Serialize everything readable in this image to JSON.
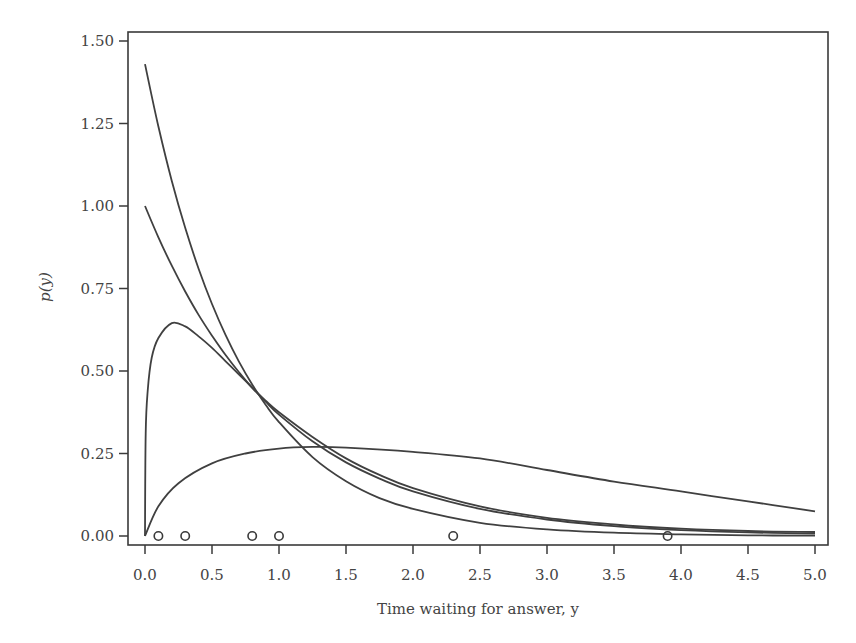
{
  "chart_data": {
    "type": "line",
    "title": "",
    "xlabel": "Time waiting for answer, y",
    "ylabel": "p(y)",
    "xlim": [
      0,
      5
    ],
    "ylim": [
      0,
      1.5
    ],
    "x_ticks": [
      "0.0",
      "0.5",
      "1.0",
      "1.5",
      "2.0",
      "2.5",
      "3.0",
      "3.5",
      "4.0",
      "4.5",
      "5.0"
    ],
    "y_ticks": [
      "0.00",
      "0.25",
      "0.50",
      "0.75",
      "1.00",
      "1.25",
      "1.50"
    ],
    "grid": false,
    "legend": null,
    "line_color": "#404040",
    "series": [
      {
        "name": "density-1",
        "x": [
          0.0,
          0.1,
          0.2,
          0.3,
          0.4,
          0.5,
          0.6,
          0.7,
          0.8,
          0.9,
          1.0,
          1.25,
          1.5,
          1.75,
          2.0,
          2.5,
          3.0,
          3.5,
          4.0,
          4.5,
          5.0
        ],
        "y": [
          1.43,
          1.241,
          1.076,
          0.934,
          0.81,
          0.703,
          0.61,
          0.529,
          0.459,
          0.398,
          0.345,
          0.239,
          0.166,
          0.115,
          0.082,
          0.04,
          0.02,
          0.01,
          0.005,
          0.002,
          0.001
        ]
      },
      {
        "name": "density-2",
        "x": [
          0.0,
          0.1,
          0.2,
          0.3,
          0.4,
          0.5,
          0.6,
          0.7,
          0.8,
          0.9,
          1.0,
          1.25,
          1.5,
          1.75,
          2.0,
          2.5,
          3.0,
          3.5,
          4.0,
          4.5,
          5.0
        ],
        "y": [
          1.0,
          0.905,
          0.819,
          0.741,
          0.67,
          0.607,
          0.549,
          0.497,
          0.449,
          0.407,
          0.368,
          0.287,
          0.223,
          0.174,
          0.135,
          0.082,
          0.05,
          0.03,
          0.018,
          0.011,
          0.007
        ]
      },
      {
        "name": "density-3",
        "x": [
          0.0,
          0.005,
          0.02,
          0.05,
          0.1,
          0.2,
          0.3,
          0.4,
          0.5,
          0.6,
          0.7,
          0.8,
          0.9,
          1.0,
          1.25,
          1.5,
          1.75,
          2.0,
          2.5,
          3.0,
          3.5,
          4.0,
          4.5,
          5.0
        ],
        "y": [
          0.0,
          0.31,
          0.44,
          0.54,
          0.6,
          0.645,
          0.635,
          0.605,
          0.57,
          0.53,
          0.49,
          0.45,
          0.41,
          0.375,
          0.3,
          0.235,
          0.185,
          0.145,
          0.09,
          0.055,
          0.035,
          0.022,
          0.015,
          0.012
        ]
      },
      {
        "name": "density-4",
        "x": [
          0.0,
          0.1,
          0.25,
          0.5,
          0.75,
          1.0,
          1.25,
          1.5,
          2.0,
          2.5,
          3.0,
          3.5,
          4.0,
          4.5,
          5.0
        ],
        "y": [
          0.0,
          0.09,
          0.16,
          0.22,
          0.25,
          0.265,
          0.27,
          0.268,
          0.255,
          0.235,
          0.2,
          0.165,
          0.135,
          0.105,
          0.075
        ]
      }
    ],
    "observations": {
      "marker": "open-circle",
      "y": 0.0,
      "x": [
        0.1,
        0.3,
        0.8,
        1.0,
        2.3,
        3.9
      ]
    }
  }
}
